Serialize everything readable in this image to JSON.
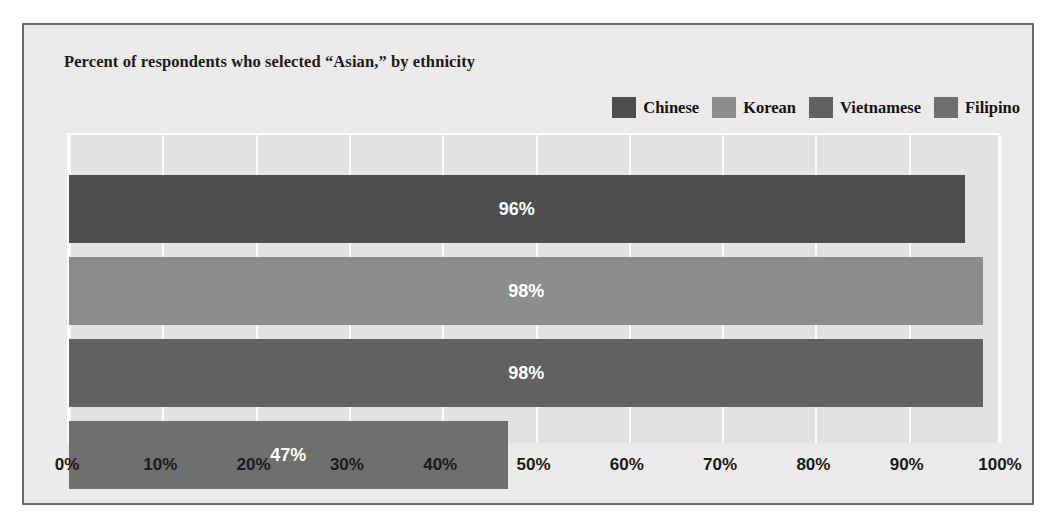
{
  "chart_data": {
    "type": "bar",
    "orientation": "horizontal",
    "title": "Percent of respondents who selected “Asian,” by ethnicity",
    "xlabel": "",
    "ylabel": "",
    "xlim": [
      0,
      100
    ],
    "xticks": [
      "0%",
      "10%",
      "20%",
      "30%",
      "40%",
      "50%",
      "60%",
      "70%",
      "80%",
      "90%",
      "100%"
    ],
    "xtick_values": [
      0,
      10,
      20,
      30,
      40,
      50,
      60,
      70,
      80,
      90,
      100
    ],
    "grid": true,
    "grid_axis": "x",
    "legend_position": "top-right",
    "categories": [
      "Chinese",
      "Korean",
      "Vietnamese",
      "Filipino"
    ],
    "values": [
      96,
      98,
      98,
      47
    ],
    "value_labels": [
      "96%",
      "98%",
      "98%",
      "47%"
    ],
    "colors": [
      "#4e4e4e",
      "#8d8d8d",
      "#616161",
      "#6f6f6f"
    ],
    "bars": [
      {
        "category": "Chinese",
        "value": 96,
        "label": "96%",
        "color": "#4e4e4e"
      },
      {
        "category": "Korean",
        "value": 98,
        "label": "98%",
        "color": "#8d8d8d"
      },
      {
        "category": "Vietnamese",
        "value": 98,
        "label": "98%",
        "color": "#616161"
      },
      {
        "category": "Filipino",
        "value": 47,
        "label": "47%",
        "color": "#6f6f6f"
      }
    ],
    "legend": [
      {
        "label": "Chinese",
        "color": "#4e4e4e"
      },
      {
        "label": "Korean",
        "color": "#8d8d8d"
      },
      {
        "label": "Vietnamese",
        "color": "#616161"
      },
      {
        "label": "Filipino",
        "color": "#6f6f6f"
      }
    ]
  },
  "figure": {
    "border_color": "#6a6a6a",
    "background": "#eceaea",
    "plot_background": "#e3e2e2",
    "gridline_color": "#fbfbfb"
  }
}
